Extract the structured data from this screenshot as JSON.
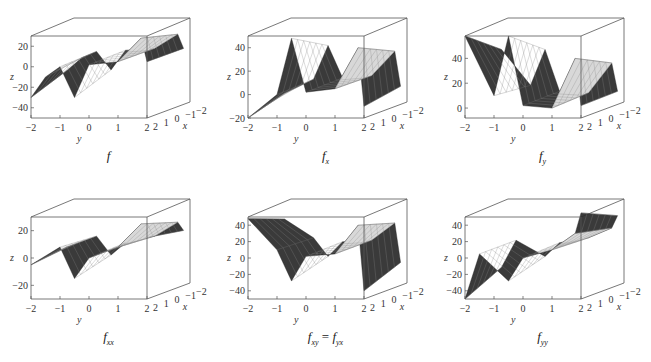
{
  "figure": {
    "layout": "2x3 grid of 3D surface plots",
    "box_color": "#555555",
    "surface_dark": "#2a2a2a",
    "surface_light": "#d8d8d8"
  },
  "chart_data": [
    {
      "type": "surface3d",
      "caption": "f",
      "caption_sub": "",
      "xlabel": "x",
      "ylabel": "y",
      "zlabel": "z",
      "y_ticks": [
        "−2",
        "−1",
        "0",
        "1",
        "2"
      ],
      "x_ticks": [
        "2",
        "1",
        "0",
        "−1",
        "−2"
      ],
      "z_ticks": [
        "20",
        "0",
        "−20",
        "−40"
      ],
      "xlim": [
        -2,
        2
      ],
      "ylim": [
        -2,
        2
      ],
      "zlim": [
        -50,
        30
      ],
      "profile": [
        [
          -2,
          -30
        ],
        [
          -1.5,
          -10
        ],
        [
          -1,
          0
        ],
        [
          -0.5,
          -30
        ],
        [
          0,
          2
        ],
        [
          1,
          5
        ],
        [
          1.8,
          28
        ],
        [
          2,
          5
        ]
      ]
    },
    {
      "type": "surface3d",
      "caption": "f",
      "caption_sub": "x",
      "xlabel": "x",
      "ylabel": "y",
      "zlabel": "z",
      "y_ticks": [
        "−2",
        "−1",
        "0",
        "1",
        "2"
      ],
      "x_ticks": [
        "2",
        "1",
        "0",
        "−1",
        "−2"
      ],
      "z_ticks": [
        "40",
        "20",
        "0",
        "−20"
      ],
      "xlim": [
        -2,
        2
      ],
      "ylim": [
        -2,
        2
      ],
      "zlim": [
        -20,
        50
      ],
      "profile": [
        [
          -2,
          -20
        ],
        [
          -1,
          0
        ],
        [
          -0.5,
          48
        ],
        [
          0,
          2
        ],
        [
          1,
          5
        ],
        [
          1.8,
          40
        ],
        [
          2,
          -10
        ]
      ]
    },
    {
      "type": "surface3d",
      "caption": "f",
      "caption_sub": "y",
      "xlabel": "x",
      "ylabel": "y",
      "zlabel": "z",
      "y_ticks": [
        "−2",
        "−1",
        "0",
        "1",
        "2"
      ],
      "x_ticks": [
        "2",
        "1",
        "0",
        "−1",
        "−2"
      ],
      "z_ticks": [
        "40",
        "20",
        "0"
      ],
      "xlim": [
        -2,
        2
      ],
      "ylim": [
        -2,
        2
      ],
      "zlim": [
        -8,
        58
      ],
      "profile": [
        [
          -2,
          58
        ],
        [
          -1,
          10
        ],
        [
          -0.5,
          58
        ],
        [
          0,
          2
        ],
        [
          1,
          0
        ],
        [
          1.8,
          40
        ],
        [
          2,
          2
        ]
      ]
    },
    {
      "type": "surface3d",
      "caption": "f",
      "caption_sub": "xx",
      "xlabel": "x",
      "ylabel": "y",
      "zlabel": "z",
      "y_ticks": [
        "−2",
        "−1",
        "0",
        "1",
        "2"
      ],
      "x_ticks": [
        "2",
        "1",
        "0",
        "−1",
        "−2"
      ],
      "z_ticks": [
        "20",
        "0",
        "−20"
      ],
      "xlim": [
        -2,
        2
      ],
      "ylim": [
        -2,
        2
      ],
      "zlim": [
        -30,
        30
      ],
      "profile": [
        [
          -2,
          -5
        ],
        [
          -1,
          8
        ],
        [
          -0.5,
          -15
        ],
        [
          0,
          0
        ],
        [
          1,
          8
        ],
        [
          1.8,
          25
        ],
        [
          2,
          15
        ]
      ]
    },
    {
      "type": "surface3d",
      "caption": "f",
      "caption_sub": "xy",
      "caption_eq": " = ",
      "caption2": "f",
      "caption2_sub": "yx",
      "xlabel": "x",
      "ylabel": "y",
      "zlabel": "z",
      "y_ticks": [
        "−2",
        "−1",
        "0",
        "1",
        "2"
      ],
      "x_ticks": [
        "2",
        "1",
        "0",
        "−1",
        "−2"
      ],
      "z_ticks": [
        "40",
        "20",
        "0",
        "−20",
        "−40"
      ],
      "xlim": [
        -2,
        2
      ],
      "ylim": [
        -2,
        2
      ],
      "zlim": [
        -50,
        50
      ],
      "profile": [
        [
          -2,
          48
        ],
        [
          -1,
          10
        ],
        [
          -0.5,
          -28
        ],
        [
          0,
          2
        ],
        [
          1,
          5
        ],
        [
          1.8,
          40
        ],
        [
          2,
          -40
        ]
      ]
    },
    {
      "type": "surface3d",
      "caption": "f",
      "caption_sub": "yy",
      "xlabel": "x",
      "ylabel": "y",
      "zlabel": "z",
      "y_ticks": [
        "−2",
        "−1",
        "0",
        "1",
        "2"
      ],
      "x_ticks": [
        "2",
        "1",
        "0",
        "−1",
        "−2"
      ],
      "z_ticks": [
        "40",
        "20",
        "0",
        "−20",
        "−40"
      ],
      "xlim": [
        -2,
        2
      ],
      "ylim": [
        -2,
        2
      ],
      "zlim": [
        -50,
        50
      ],
      "profile": [
        [
          -2,
          -50
        ],
        [
          -1.5,
          5
        ],
        [
          -0.5,
          -28
        ],
        [
          0,
          0
        ],
        [
          1,
          10
        ],
        [
          1.8,
          30
        ],
        [
          2,
          55
        ]
      ]
    }
  ]
}
